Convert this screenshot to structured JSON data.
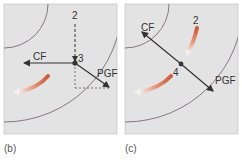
{
  "panels": [
    {
      "id": "b",
      "caption": "(b)",
      "labels": {
        "cf": "CF",
        "pgf": "PGF",
        "start": "2",
        "point": "3"
      }
    },
    {
      "id": "c",
      "caption": "(c)",
      "labels": {
        "cf": "CF",
        "pgf": "PGF",
        "start": "2",
        "point": "4"
      }
    }
  ],
  "colors": {
    "panel_bg": "#e3e3e3",
    "isobar": "#7a6a7a",
    "vector": "#333333",
    "wind_arrow": "#d96a4a"
  }
}
